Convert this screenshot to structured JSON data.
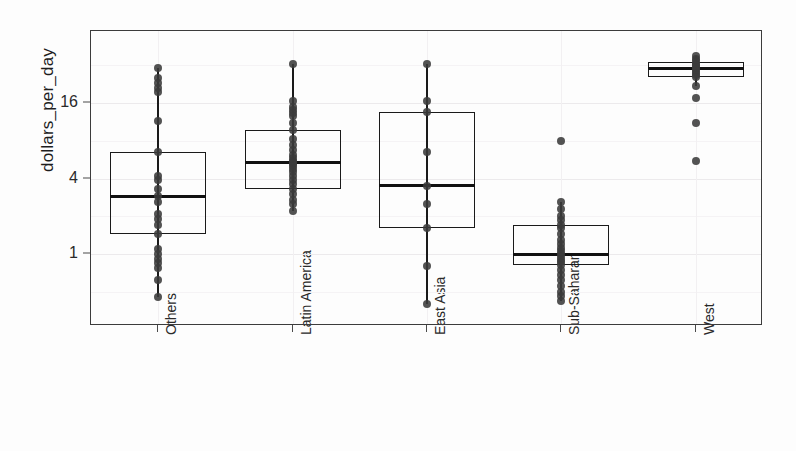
{
  "chart_data": {
    "type": "box",
    "title": "",
    "xlabel": "",
    "ylabel": "dollars_per_day",
    "yscale": "log2",
    "ylim": [
      0.35,
      48
    ],
    "grid": true,
    "legend": "none",
    "ytick_labels": [
      "16",
      "4",
      "1"
    ],
    "ytick_values": [
      16,
      4,
      1
    ],
    "categories": [
      "Others",
      "Latin America",
      "East Asia",
      "Sub-Saharan",
      "West"
    ],
    "series": [
      {
        "name": "Others",
        "q1": 1.45,
        "median": 2.9,
        "q3": 6.5,
        "whisker_low": 0.45,
        "whisker_high": 30.5,
        "points": [
          30.5,
          25.5,
          23.0,
          21.0,
          19.5,
          11.5,
          6.5,
          4.2,
          3.9,
          3.3,
          2.9,
          2.6,
          2.1,
          1.9,
          1.7,
          1.45,
          1.1,
          1.0,
          0.92,
          0.85,
          0.78,
          0.62,
          0.45
        ]
      },
      {
        "name": "Latin America",
        "q1": 3.3,
        "median": 5.4,
        "q3": 9.8,
        "whisker_low": 2.2,
        "whisker_high": 33.0,
        "points": [
          33.0,
          16.5,
          15.0,
          14.0,
          13.2,
          12.6,
          11.0,
          9.8,
          8.2,
          7.4,
          6.8,
          6.2,
          5.8,
          5.5,
          5.4,
          5.2,
          5.0,
          4.8,
          4.5,
          4.2,
          3.9,
          3.6,
          3.3,
          3.0,
          2.7,
          2.5,
          2.2
        ]
      },
      {
        "name": "East Asia",
        "q1": 1.6,
        "median": 3.5,
        "q3": 13.5,
        "whisker_low": 0.4,
        "whisker_high": 33.0,
        "points": [
          33.0,
          16.5,
          13.5,
          6.5,
          3.5,
          2.5,
          1.6,
          0.8,
          0.4
        ]
      },
      {
        "name": "Sub-Saharan",
        "q1": 0.82,
        "median": 1.0,
        "q3": 1.7,
        "whisker_low": 0.42,
        "whisker_high": 2.6,
        "points": [
          8.0,
          2.6,
          2.3,
          2.0,
          1.85,
          1.7,
          1.6,
          1.45,
          1.3,
          1.2,
          1.12,
          1.05,
          1.0,
          0.95,
          0.9,
          0.86,
          0.82,
          0.75,
          0.68,
          0.62,
          0.56,
          0.5,
          0.46,
          0.42
        ]
      },
      {
        "name": "West",
        "q1": 26.0,
        "median": 30.0,
        "q3": 34.0,
        "whisker_low": 22.0,
        "whisker_high": 38.0,
        "points": [
          38.0,
          36.0,
          34.5,
          33.0,
          32.0,
          31.0,
          30.0,
          29.0,
          28.0,
          27.0,
          26.0,
          22.0,
          17.5,
          11.0,
          5.5
        ]
      }
    ]
  },
  "axes": {
    "y_title": "dollars_per_day"
  }
}
